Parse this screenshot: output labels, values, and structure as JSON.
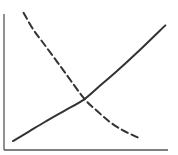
{
  "chart_data": {
    "type": "line",
    "title": "",
    "xlabel": "",
    "ylabel": "",
    "xlim": [
      0,
      10
    ],
    "ylim": [
      0,
      10
    ],
    "grid": false,
    "legend": "none",
    "series": [
      {
        "name": "increasing curve",
        "style": "solid",
        "color": "#333333",
        "x": [
          0.55,
          1.5,
          2.5,
          3.7,
          4.9,
          5.9,
          6.9,
          8.3,
          9.9
        ],
        "y": [
          0.64,
          1.3,
          2.0,
          2.8,
          3.6,
          4.6,
          5.6,
          7.1,
          8.9
        ]
      },
      {
        "name": "decreasing curve",
        "style": "dashed",
        "color": "#333333",
        "x": [
          1.2,
          1.8,
          2.5,
          3.7,
          4.9,
          5.7,
          6.5,
          7.3,
          8.2
        ],
        "y": [
          9.8,
          8.6,
          7.5,
          5.6,
          3.7,
          2.8,
          2.0,
          1.4,
          0.9
        ]
      }
    ]
  }
}
